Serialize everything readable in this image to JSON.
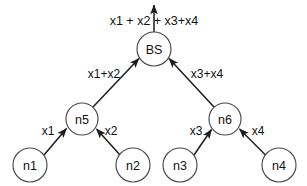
{
  "diagram": {
    "type": "data-aggregation-tree",
    "canvas": {
      "width": 307,
      "height": 186,
      "background": "#ffffff"
    },
    "style": {
      "node_stroke": "#4a4a4a",
      "node_fill": "#ffffff",
      "edge_color": "#1c1c1c",
      "text_color": "#111111"
    },
    "output_label": "x1 + x2 + x3+x4",
    "nodes": [
      {
        "id": "bs",
        "label": "BS",
        "cx": 154,
        "cy": 49,
        "r": 17
      },
      {
        "id": "n5",
        "label": "n5",
        "cx": 82,
        "cy": 119,
        "r": 16
      },
      {
        "id": "n6",
        "label": "n6",
        "cx": 225,
        "cy": 119,
        "r": 16
      },
      {
        "id": "n1",
        "label": "n1",
        "cx": 30,
        "cy": 165,
        "r": 17
      },
      {
        "id": "n2",
        "label": "n2",
        "cx": 133,
        "cy": 165,
        "r": 17
      },
      {
        "id": "n3",
        "label": "n3",
        "cx": 180,
        "cy": 165,
        "r": 17
      },
      {
        "id": "n4",
        "label": "n4",
        "cx": 279,
        "cy": 165,
        "r": 17
      }
    ],
    "edges": [
      {
        "id": "e-n1-n5",
        "from": "n1",
        "to": "n5",
        "label": "x1",
        "label_x": 48,
        "label_y": 131
      },
      {
        "id": "e-n2-n5",
        "from": "n2",
        "to": "n5",
        "label": "x2",
        "label_x": 111,
        "label_y": 131
      },
      {
        "id": "e-n3-n6",
        "from": "n3",
        "to": "n6",
        "label": "x3",
        "label_x": 196,
        "label_y": 131
      },
      {
        "id": "e-n4-n6",
        "from": "n4",
        "to": "n6",
        "label": "x4",
        "label_x": 258,
        "label_y": 131
      },
      {
        "id": "e-n5-bs",
        "from": "n5",
        "to": "bs",
        "label": "x1+x2",
        "label_x": 104,
        "label_y": 74
      },
      {
        "id": "e-n6-bs",
        "from": "n6",
        "to": "bs",
        "label": "x3+x4",
        "label_x": 207,
        "label_y": 74
      },
      {
        "id": "e-bs-out",
        "from": "bs",
        "to": "out",
        "label": "",
        "label_x": 0,
        "label_y": 0
      }
    ]
  }
}
